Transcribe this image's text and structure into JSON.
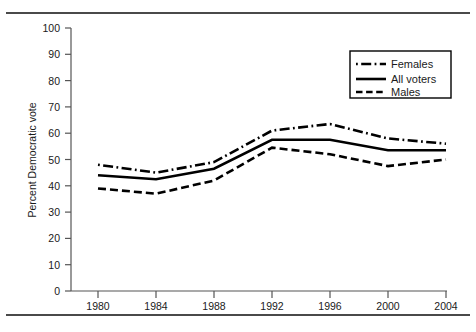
{
  "chart_data": {
    "type": "line",
    "title": "",
    "xlabel": "",
    "ylabel": "Percent Democratic vote",
    "x": [
      1980,
      1984,
      1988,
      1992,
      1996,
      2000,
      2004
    ],
    "categories": [
      "1980",
      "1984",
      "1988",
      "1992",
      "1996",
      "2000",
      "2004"
    ],
    "xlim": [
      1978,
      2006
    ],
    "ylim": [
      0,
      100
    ],
    "ytick_values": [
      0,
      10,
      20,
      30,
      40,
      50,
      60,
      70,
      80,
      90,
      100
    ],
    "ytick_labels": [
      "0",
      "10",
      "20",
      "30",
      "40",
      "50",
      "60",
      "70",
      "80",
      "90",
      "100"
    ],
    "grid": false,
    "legend_position": "upper right",
    "series": [
      {
        "name": "Females",
        "style": "dash-dot",
        "color": "#000000",
        "values": [
          48,
          45,
          49,
          61,
          63.5,
          58,
          56
        ]
      },
      {
        "name": "All voters",
        "style": "solid",
        "color": "#000000",
        "values": [
          44,
          42.5,
          46.5,
          57.5,
          57.5,
          53.5,
          53.5
        ]
      },
      {
        "name": "Males",
        "style": "dashed",
        "color": "#000000",
        "values": [
          39,
          37,
          42,
          54.5,
          52,
          47.5,
          50
        ]
      }
    ]
  },
  "axes": {
    "y_axis_title": "Percent Democratic vote"
  },
  "legend": {
    "entries": [
      {
        "label": "Females"
      },
      {
        "label": "All voters"
      },
      {
        "label": "Males"
      }
    ]
  },
  "colors": {
    "line": "#000000",
    "axis": "#555555",
    "rule": "#4a4a4a",
    "text": "#1a1a1a"
  }
}
